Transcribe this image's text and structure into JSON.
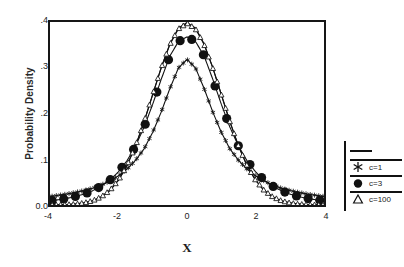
{
  "figure": {
    "background_color": "#ffffff",
    "line_color": "#111111"
  },
  "axes": {
    "ylabel": "Probability Density",
    "xlabel": "X",
    "yticks": [
      "0.0",
      ".1",
      ".2",
      ".3",
      ".4"
    ],
    "xticks": [
      "-4",
      "-2",
      "0",
      "2",
      "4"
    ]
  },
  "legend": {
    "entries": [
      {
        "label": "",
        "marker": "line",
        "marker_name": "plain-line-marker"
      },
      {
        "label": "c=1",
        "marker": "asterisk",
        "marker_name": "asterisk-marker"
      },
      {
        "label": "c=3",
        "marker": "filled-circle",
        "marker_name": "filled-circle-marker"
      },
      {
        "label": "c=100",
        "marker": "open-triangle",
        "marker_name": "open-triangle-marker"
      }
    ]
  },
  "chart_data": {
    "type": "line",
    "title": "",
    "xlabel": "X",
    "ylabel": "Probability Density",
    "xlim": [
      -4,
      4
    ],
    "ylim": [
      0.0,
      0.4
    ],
    "xticks": [
      -4,
      -2,
      0,
      2,
      4
    ],
    "yticks": [
      0.0,
      0.1,
      0.2,
      0.3,
      0.4
    ],
    "grid": false,
    "legend_position": "right",
    "x": [
      -4.0,
      -3.75,
      -3.5,
      -3.25,
      -3.0,
      -2.75,
      -2.5,
      -2.25,
      -2.0,
      -1.75,
      -1.5,
      -1.25,
      -1.0,
      -0.75,
      -0.5,
      -0.25,
      0.0,
      0.25,
      0.5,
      0.75,
      1.0,
      1.25,
      1.5,
      1.75,
      2.0,
      2.25,
      2.5,
      2.75,
      3.0,
      3.25,
      3.5,
      3.75,
      4.0
    ],
    "series": [
      {
        "name": "",
        "marker": "none",
        "values": [
          0.0002,
          0.0004,
          0.0009,
          0.002,
          0.0044,
          0.0091,
          0.0175,
          0.0317,
          0.054,
          0.0863,
          0.1295,
          0.1826,
          0.242,
          0.3011,
          0.3521,
          0.3867,
          0.3989,
          0.3867,
          0.3521,
          0.3011,
          0.242,
          0.1826,
          0.1295,
          0.0863,
          0.054,
          0.0317,
          0.0175,
          0.0091,
          0.0044,
          0.002,
          0.0009,
          0.0004,
          0.0002
        ]
      },
      {
        "name": "c=1",
        "marker": "asterisk",
        "values": [
          0.0187,
          0.0212,
          0.0241,
          0.0277,
          0.0318,
          0.0369,
          0.0439,
          0.0527,
          0.0637,
          0.0786,
          0.0979,
          0.1231,
          0.1592,
          0.2037,
          0.2546,
          0.2995,
          0.3183,
          0.2995,
          0.2546,
          0.2037,
          0.1592,
          0.1231,
          0.0979,
          0.0786,
          0.0637,
          0.0527,
          0.0439,
          0.0369,
          0.0318,
          0.0277,
          0.0241,
          0.0212,
          0.0187
        ]
      },
      {
        "name": "c=3",
        "marker": "filled-circle",
        "values": [
          0.0092,
          0.0115,
          0.0146,
          0.0187,
          0.024,
          0.0313,
          0.0412,
          0.0546,
          0.0727,
          0.097,
          0.1292,
          0.1706,
          0.2206,
          0.2754,
          0.3257,
          0.3572,
          0.3676,
          0.3572,
          0.3257,
          0.2754,
          0.2206,
          0.1706,
          0.1292,
          0.097,
          0.0727,
          0.0546,
          0.0412,
          0.0313,
          0.024,
          0.0187,
          0.0146,
          0.0115,
          0.0092
        ]
      },
      {
        "name": "c=100",
        "marker": "open-triangle",
        "values": [
          0.0003,
          0.0006,
          0.0011,
          0.0023,
          0.0048,
          0.0096,
          0.0181,
          0.0323,
          0.0546,
          0.0868,
          0.1299,
          0.1828,
          0.2418,
          0.3004,
          0.3509,
          0.3852,
          0.3974,
          0.3852,
          0.3509,
          0.3004,
          0.2418,
          0.1828,
          0.1299,
          0.0868,
          0.0546,
          0.0323,
          0.0181,
          0.0096,
          0.0048,
          0.0023,
          0.0011,
          0.0006,
          0.0003
        ]
      }
    ]
  }
}
